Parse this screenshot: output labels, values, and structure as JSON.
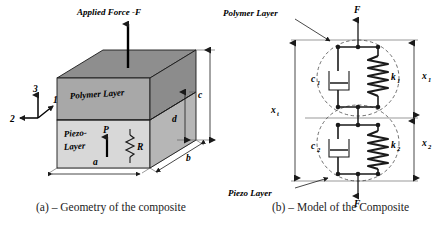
{
  "figure": {
    "panel_a": {
      "caption": "(a) – Geometry of the composite",
      "applied_force_label": "Applied Force -F",
      "polymer_layer_label": "Polymer Layer",
      "piezo_layer_label_line1": "Piezo-",
      "piezo_layer_label_line2": "Layer",
      "polarization_label": "P",
      "resistor_label": "R",
      "axes": {
        "axis_1": "1",
        "axis_2": "2",
        "axis_3": "3"
      },
      "dimensions": {
        "a": "a",
        "b": "b",
        "c": "c",
        "d": "d"
      },
      "colors": {
        "top_face": "#8e8e8e",
        "polymer_front": "#a8a8a8",
        "polymer_side": "#8a8a8a",
        "piezo_front": "#d6d6d6",
        "piezo_side": "#b4b4b4",
        "ground_face": "#f2f2f2",
        "outline": "#1a1a1a"
      }
    },
    "panel_b": {
      "caption": "(b) – Model of the Composite",
      "polymer_layer_callout": "Polymer Layer",
      "piezo_layer_callout": "Piezo Layer",
      "force_top": "F",
      "force_bottom": "F",
      "damper_1": "c",
      "damper_1_sub": "1",
      "spring_1": "k",
      "spring_1_sub": "1",
      "damper_2": "c",
      "damper_2_sub": "2",
      "spring_2": "k",
      "spring_2_sub": "2",
      "disp_total": "x",
      "disp_total_sub": "t",
      "disp_1": "x",
      "disp_1_sub": "1",
      "disp_2": "x",
      "disp_2_sub": "2",
      "colors": {
        "wire": "#1a1a1a",
        "dashed_group": "#555555",
        "dim_line": "#777777",
        "spring": "#2a2a2a"
      }
    }
  }
}
